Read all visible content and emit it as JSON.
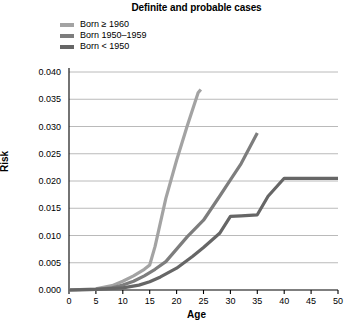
{
  "chart_data": {
    "type": "line",
    "title": "Definite and probable cases",
    "xlabel": "Age",
    "ylabel": "Risk",
    "xlim": [
      0,
      50
    ],
    "ylim": [
      0.0,
      0.04
    ],
    "xticks": [
      0,
      5,
      10,
      15,
      20,
      25,
      30,
      35,
      40,
      45,
      50
    ],
    "xtick_labels": [
      "0",
      "5",
      "10",
      "15",
      "20",
      "25",
      "30",
      "35",
      "40",
      "45",
      "50"
    ],
    "yticks": [
      0.0,
      0.005,
      0.01,
      0.015,
      0.02,
      0.025,
      0.03,
      0.035,
      0.04
    ],
    "ytick_labels": [
      "0.000",
      "0.005",
      "0.010",
      "0.015",
      "0.020",
      "0.025",
      "0.030",
      "0.035",
      "0.040"
    ],
    "grid": "horizontal",
    "legend_position": "top-left",
    "series": [
      {
        "name": "Born ≥ 1960",
        "color": "#a3a3a3",
        "x": [
          0,
          5,
          8,
          10,
          12,
          14,
          15,
          16,
          18,
          20,
          22,
          24,
          24.5
        ],
        "y": [
          0.0,
          0.0002,
          0.0008,
          0.0016,
          0.0026,
          0.0038,
          0.0046,
          0.008,
          0.0168,
          0.0238,
          0.0302,
          0.0362,
          0.0368
        ]
      },
      {
        "name": "Born 1950–1959",
        "color": "#7d7d7d",
        "x": [
          0,
          5,
          8,
          10,
          12,
          14,
          16,
          18,
          20,
          22,
          25,
          28,
          30,
          32,
          35
        ],
        "y": [
          0.0,
          0.0001,
          0.0004,
          0.0009,
          0.0016,
          0.0026,
          0.0038,
          0.0052,
          0.0075,
          0.0098,
          0.0128,
          0.0172,
          0.0202,
          0.0232,
          0.0288
        ]
      },
      {
        "name": "Born < 1950",
        "color": "#666666",
        "x": [
          0,
          5,
          10,
          13,
          15,
          17,
          20,
          23,
          25,
          28,
          30,
          32,
          35,
          37,
          40,
          45,
          50
        ],
        "y": [
          0.0,
          0.0001,
          0.0004,
          0.0009,
          0.0015,
          0.0024,
          0.004,
          0.0062,
          0.0078,
          0.0104,
          0.0135,
          0.0136,
          0.0138,
          0.0172,
          0.0205,
          0.0205,
          0.0205
        ]
      }
    ]
  },
  "legend": {
    "items": [
      {
        "label": "Born ≥ 1960",
        "color": "#a3a3a3"
      },
      {
        "label": "Born 1950–1959",
        "color": "#7d7d7d"
      },
      {
        "label": "Born < 1950",
        "color": "#666666"
      }
    ]
  }
}
